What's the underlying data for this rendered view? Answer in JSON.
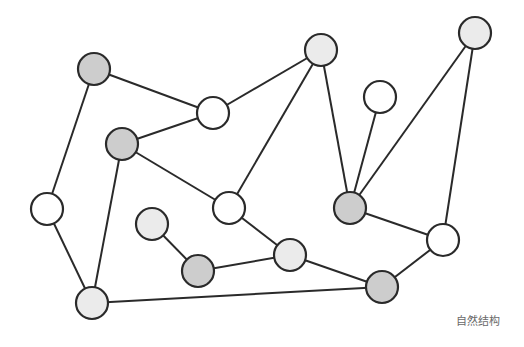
{
  "diagram": {
    "caption": "自然结构",
    "node_radius": 16,
    "colors": {
      "stroke": "#2a2a2a",
      "dark": "#cdcdcd",
      "light": "#ebebeb",
      "white": "#ffffff",
      "caption": "#6a6a6a"
    },
    "nodes": [
      {
        "id": "A",
        "x": 94,
        "y": 69,
        "fill": "dark"
      },
      {
        "id": "B",
        "x": 122,
        "y": 144,
        "fill": "dark"
      },
      {
        "id": "C",
        "x": 475,
        "y": 33,
        "fill": "light"
      },
      {
        "id": "D",
        "x": 213,
        "y": 113,
        "fill": "white"
      },
      {
        "id": "E",
        "x": 321,
        "y": 50,
        "fill": "light"
      },
      {
        "id": "F",
        "x": 350,
        "y": 208,
        "fill": "dark"
      },
      {
        "id": "G",
        "x": 380,
        "y": 97,
        "fill": "white"
      },
      {
        "id": "H",
        "x": 229,
        "y": 208,
        "fill": "white"
      },
      {
        "id": "I",
        "x": 443,
        "y": 240,
        "fill": "white"
      },
      {
        "id": "J",
        "x": 290,
        "y": 255,
        "fill": "light"
      },
      {
        "id": "K",
        "x": 382,
        "y": 287,
        "fill": "dark"
      },
      {
        "id": "L",
        "x": 47,
        "y": 209,
        "fill": "white"
      },
      {
        "id": "M",
        "x": 92,
        "y": 303,
        "fill": "light"
      },
      {
        "id": "N",
        "x": 152,
        "y": 224,
        "fill": "light"
      },
      {
        "id": "O",
        "x": 198,
        "y": 271,
        "fill": "dark"
      }
    ],
    "edges": [
      [
        "A",
        "D"
      ],
      [
        "A",
        "L"
      ],
      [
        "B",
        "D"
      ],
      [
        "B",
        "M"
      ],
      [
        "B",
        "H"
      ],
      [
        "D",
        "E"
      ],
      [
        "E",
        "H"
      ],
      [
        "E",
        "F"
      ],
      [
        "G",
        "F"
      ],
      [
        "C",
        "F"
      ],
      [
        "C",
        "I"
      ],
      [
        "F",
        "I"
      ],
      [
        "I",
        "K"
      ],
      [
        "H",
        "J"
      ],
      [
        "J",
        "K"
      ],
      [
        "N",
        "O"
      ],
      [
        "O",
        "J"
      ],
      [
        "L",
        "M"
      ],
      [
        "M",
        "K"
      ]
    ]
  }
}
